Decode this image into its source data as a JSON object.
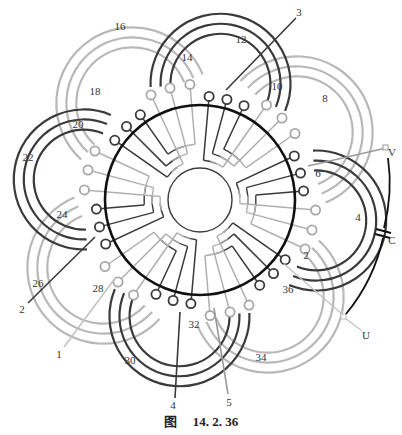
{
  "figure": {
    "caption_prefix": "图",
    "caption_number": "14. 2. 36",
    "colors": {
      "dark": "#3a3a3a",
      "light": "#b8b8b8",
      "ring": "#111111",
      "text": "#333333"
    },
    "slot_labels": [
      {
        "text": "16",
        "x": 120,
        "y": 27
      },
      {
        "text": "14",
        "x": 187,
        "y": 58
      },
      {
        "text": "12",
        "x": 241,
        "y": 40
      },
      {
        "text": "3",
        "x": 299,
        "y": 13
      },
      {
        "text": "10",
        "x": 277,
        "y": 87
      },
      {
        "text": "8",
        "x": 325,
        "y": 99
      },
      {
        "text": "18",
        "x": 95,
        "y": 92
      },
      {
        "text": "20",
        "x": 78,
        "y": 125
      },
      {
        "text": "22",
        "x": 28,
        "y": 158
      },
      {
        "text": "V",
        "x": 392,
        "y": 153
      },
      {
        "text": "6",
        "x": 318,
        "y": 174
      },
      {
        "text": "4",
        "x": 358,
        "y": 218
      },
      {
        "text": "C",
        "x": 392,
        "y": 241
      },
      {
        "text": "24",
        "x": 62,
        "y": 215
      },
      {
        "text": "2",
        "x": 306,
        "y": 256
      },
      {
        "text": "26",
        "x": 38,
        "y": 284
      },
      {
        "text": "28",
        "x": 98,
        "y": 289
      },
      {
        "text": "36",
        "x": 288,
        "y": 290
      },
      {
        "text": "2",
        "x": 22,
        "y": 310
      },
      {
        "text": "32",
        "x": 194,
        "y": 325
      },
      {
        "text": "U",
        "x": 366,
        "y": 336
      },
      {
        "text": "1",
        "x": 59,
        "y": 355
      },
      {
        "text": "30",
        "x": 130,
        "y": 361
      },
      {
        "text": "34",
        "x": 261,
        "y": 358
      },
      {
        "text": "5",
        "x": 229,
        "y": 403
      },
      {
        "text": "4",
        "x": 173,
        "y": 406
      }
    ],
    "terminals": [
      {
        "name": "V",
        "label": "V"
      },
      {
        "name": "U",
        "label": "U"
      },
      {
        "name": "C",
        "label": "C"
      }
    ]
  }
}
